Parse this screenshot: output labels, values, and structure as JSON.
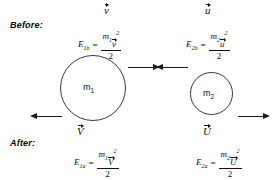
{
  "diagram": {
    "phases": {
      "before_label": "Before:",
      "after_label": "After:"
    },
    "bodies": [
      {
        "id": "m1",
        "label": "m",
        "subscript": "1",
        "shape": "circle",
        "size": "large"
      },
      {
        "id": "m2",
        "label": "m",
        "subscript": "2",
        "shape": "circle",
        "size": "small"
      }
    ],
    "vectors": [
      {
        "id": "v-before",
        "symbol": "v",
        "accent": "arrow",
        "direction": "right",
        "phase": "before",
        "body": "m1"
      },
      {
        "id": "u-before",
        "symbol": "u",
        "accent": "arrow",
        "direction": "left",
        "phase": "before",
        "body": "m2"
      },
      {
        "id": "V-after",
        "symbol": "V",
        "accent": "arrow",
        "direction": "left",
        "phase": "after",
        "body": "m1"
      },
      {
        "id": "U-after",
        "symbol": "U",
        "accent": "arrow",
        "direction": "right",
        "phase": "after",
        "body": "m2"
      }
    ],
    "equations": [
      {
        "id": "E1b",
        "lhs_symbol": "E",
        "lhs_subscript": "1b",
        "equals": "=",
        "numerator_mass": "m",
        "numerator_mass_sub": "1",
        "numerator_vector": "v",
        "numerator_power": "2",
        "denominator": "2",
        "phase": "before",
        "body": "m1"
      },
      {
        "id": "E2b",
        "lhs_symbol": "E",
        "lhs_subscript": "2b",
        "equals": "=",
        "numerator_mass": "m",
        "numerator_mass_sub": "2",
        "numerator_vector": "u",
        "numerator_power": "2",
        "denominator": "2",
        "phase": "before",
        "body": "m2"
      },
      {
        "id": "E1a",
        "lhs_symbol": "E",
        "lhs_subscript": "1a",
        "equals": "=",
        "numerator_mass": "m",
        "numerator_mass_sub": "1",
        "numerator_vector": "V",
        "numerator_power": "2",
        "denominator": "2",
        "phase": "after",
        "body": "m1"
      },
      {
        "id": "E2a",
        "lhs_symbol": "E",
        "lhs_subscript": "2a",
        "equals": "=",
        "numerator_mass": "m",
        "numerator_mass_sub": "2",
        "numerator_vector": "U",
        "numerator_power": "2",
        "denominator": "2",
        "phase": "after",
        "body": "m2"
      }
    ],
    "colors": {
      "stroke": "#3a3a3a",
      "text": "#111111",
      "background": "#ffffff"
    }
  }
}
